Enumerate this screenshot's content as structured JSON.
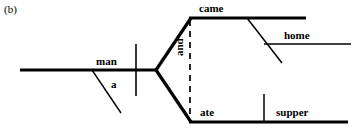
{
  "figure": {
    "label": "(b)",
    "type": "reed-kellogg-sentence-diagram",
    "sentence": "The man came home and ate supper."
  },
  "words": {
    "subject": "man",
    "subject_modifier": "a",
    "verb_1": "came",
    "verb_1_modifier": "home",
    "conjunction": "and",
    "verb_2": "ate",
    "verb_2_object": "supper"
  },
  "lines": {
    "baseline": {
      "x1": 20,
      "y1": 70,
      "x2": 157,
      "y2": 70,
      "weight": 3.2
    },
    "subject_predicate_divider": {
      "x1": 136,
      "y1": 44,
      "x2": 136,
      "y2": 96,
      "weight": 1.6
    },
    "modifier_a": {
      "x1": 92,
      "y1": 70,
      "x2": 121,
      "y2": 113,
      "weight": 1.4
    },
    "fork_upper": {
      "x1": 156,
      "y1": 70,
      "x2": 191,
      "y2": 18,
      "weight": 3.2
    },
    "fork_lower": {
      "x1": 156,
      "y1": 70,
      "x2": 191,
      "y2": 122,
      "weight": 3.2
    },
    "predicate_upper": {
      "x1": 190,
      "y1": 18,
      "x2": 306,
      "y2": 18,
      "weight": 3.2
    },
    "predicate_lower": {
      "x1": 190,
      "y1": 122,
      "x2": 348,
      "y2": 122,
      "weight": 3.2
    },
    "conjunction_dashed": {
      "x1": 190,
      "y1": 18,
      "x2": 190,
      "y2": 122,
      "weight": 1.6,
      "dash": "6 5"
    },
    "modifier_home_slant": {
      "x1": 247,
      "y1": 18,
      "x2": 282,
      "y2": 63,
      "weight": 1.4
    },
    "modifier_home_line": {
      "x1": 264,
      "y1": 44,
      "x2": 351,
      "y2": 44,
      "weight": 1.4
    },
    "object_divider": {
      "x1": 264,
      "y1": 94,
      "x2": 264,
      "y2": 122,
      "weight": 1.4
    }
  },
  "colors": {
    "ink": "#000000",
    "background": "#ffffff"
  }
}
